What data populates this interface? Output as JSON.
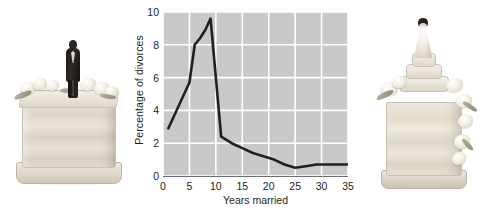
{
  "figure": {
    "left_photo": {
      "name": "half wedding cake with groom figurine",
      "alt": "groom-cake-photo"
    },
    "right_photo": {
      "name": "half wedding cake with bride figurine",
      "alt": "bride-cake-photo"
    }
  },
  "chart_data": {
    "type": "line",
    "title": "",
    "xlabel": "Years married",
    "ylabel": "Percentage of divorces",
    "xlim": [
      0,
      35
    ],
    "ylim": [
      0,
      10
    ],
    "xticks": [
      0,
      5,
      10,
      15,
      20,
      25,
      30,
      35
    ],
    "xtick_labels": [
      "0",
      "5",
      "10",
      "15",
      "20",
      "25",
      "30",
      "35"
    ],
    "yticks": [
      0,
      2,
      4,
      6,
      8,
      10
    ],
    "ytick_labels": [
      "0",
      "2",
      "4",
      "6",
      "8",
      "10"
    ],
    "grid": true,
    "grid_color": "#ffffff",
    "plot_bg": "#c9c9c9",
    "line_color": "#231f20",
    "legend": null,
    "x": [
      1,
      2,
      3,
      4,
      5,
      6,
      7,
      8,
      9,
      10,
      11,
      12,
      13,
      15,
      17,
      19,
      21,
      23,
      25,
      27,
      29,
      31,
      33,
      35
    ],
    "y": [
      2.9,
      3.6,
      4.3,
      5.0,
      5.7,
      8.0,
      8.4,
      8.9,
      9.6,
      6.0,
      2.4,
      2.2,
      2.0,
      1.7,
      1.4,
      1.2,
      1.0,
      0.7,
      0.5,
      0.6,
      0.7,
      0.7,
      0.7,
      0.7
    ]
  }
}
